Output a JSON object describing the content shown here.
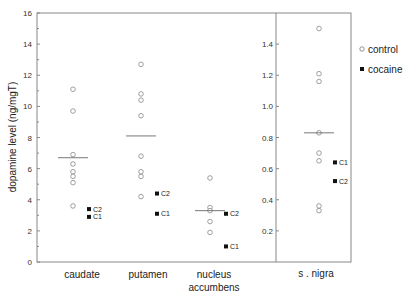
{
  "chart_data": {
    "type": "scatter",
    "title": "",
    "xlabel": "",
    "ylabel": "dopamine level (ng/mgT)",
    "ylim": [
      0,
      16
    ],
    "yticks": [
      0,
      2,
      4,
      6,
      8,
      10,
      12,
      14,
      16
    ],
    "right_axis": {
      "region": "s. nigra",
      "ylim": [
        0,
        1.6
      ],
      "yticks": [
        "0.2",
        "0.4",
        "0.6",
        "0.8",
        "1.0",
        "1.2",
        "1.4"
      ]
    },
    "categories": [
      "caudate",
      "putamen",
      "nucleus accumbens",
      "s. nigra"
    ],
    "legend": [
      {
        "name": "control",
        "marker": "open-circle"
      },
      {
        "name": "cocaine",
        "marker": "filled-square"
      }
    ],
    "legend_position": "right",
    "grid": false,
    "series": [
      {
        "name": "control",
        "values": {
          "caudate": [
            11.1,
            9.7,
            6.9,
            6.3,
            5.8,
            5.5,
            5.1,
            3.6
          ],
          "putamen": [
            12.7,
            10.8,
            10.4,
            9.4,
            6.8,
            5.8,
            5.5,
            4.2
          ],
          "nucleus accumbens": [
            5.4,
            3.5,
            3.3,
            2.6,
            1.9
          ],
          "s. nigra": [
            1.5,
            1.21,
            1.16,
            0.83,
            0.7,
            0.65,
            0.36,
            0.33
          ]
        }
      },
      {
        "name": "control mean",
        "values": {
          "caudate": 6.7,
          "putamen": 8.1,
          "nucleus accumbens": 3.3,
          "s. nigra": 0.83
        }
      },
      {
        "name": "cocaine",
        "values": {
          "caudate": [
            {
              "label": "C2",
              "y": 3.4
            },
            {
              "label": "C1",
              "y": 2.9
            }
          ],
          "putamen": [
            {
              "label": "C2",
              "y": 4.4
            },
            {
              "label": "C1",
              "y": 3.1
            }
          ],
          "nucleus accumbens": [
            {
              "label": "C2",
              "y": 3.1
            },
            {
              "label": "C1",
              "y": 1.0
            }
          ],
          "s. nigra": [
            {
              "label": "C1",
              "y": 0.64
            },
            {
              "label": "C2",
              "y": 0.52
            }
          ]
        }
      }
    ]
  },
  "labels": {
    "ylabel": "dopamine level (ng/mgT)",
    "cat0": "caudate",
    "cat1": "putamen",
    "cat2a": "nucleus",
    "cat2b": "accumbens",
    "cat3": "s . nigra",
    "legend_control": "control",
    "legend_cocaine": "cocaine"
  }
}
